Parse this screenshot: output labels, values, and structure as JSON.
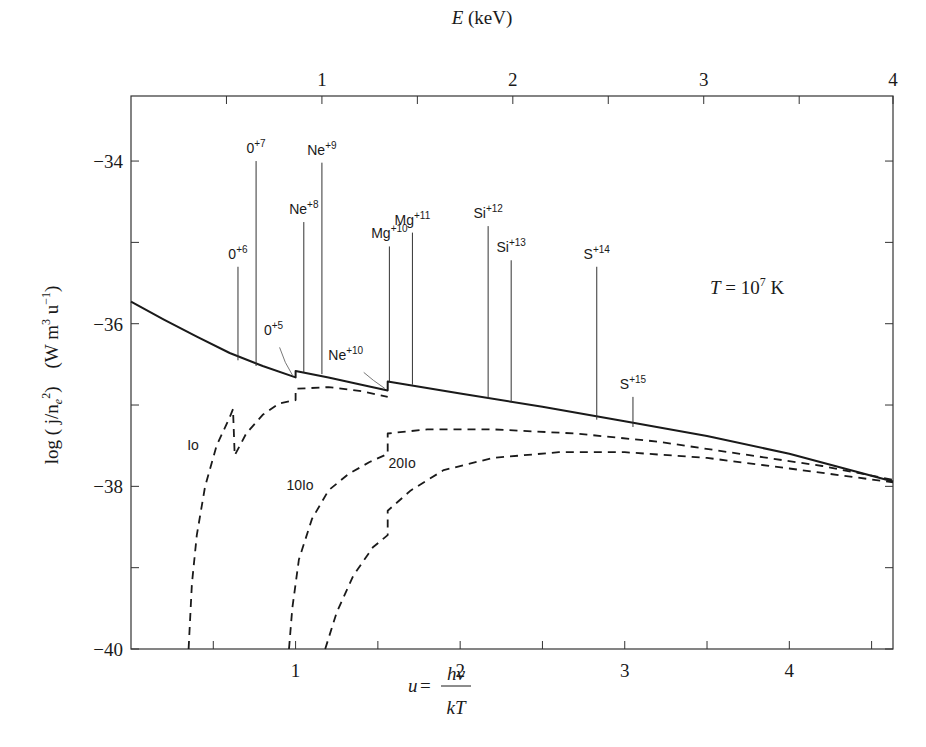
{
  "chart_data": {
    "type": "line",
    "title": "",
    "annotation": {
      "text_T": "T",
      "text_eq": " = 10",
      "text_exp": "7",
      "text_unit": " K"
    },
    "xlabel": {
      "lhs": "u",
      "eq": " = ",
      "numerator": "hν",
      "denominator": "kT"
    },
    "ylabel": {
      "main": "log ( j/n",
      "sub": "e",
      "sup": "2",
      "close": ")",
      "units": "(W m",
      "units_sup1": "3",
      "units_mid": " u",
      "units_sup2": "−1",
      "units_close": ")"
    },
    "top_xlabel": {
      "italic": "E",
      "rest": " (keV)"
    },
    "xlim": [
      0,
      4.63
    ],
    "ylim": [
      -40,
      -33.2
    ],
    "x_ticks": [
      {
        "value": 1,
        "label": "1"
      },
      {
        "value": 2,
        "label": "2"
      },
      {
        "value": 3,
        "label": "3"
      },
      {
        "value": 4,
        "label": "4"
      }
    ],
    "x_minor_ticks": [
      0.5,
      1.5,
      2.5,
      3.5,
      4.5
    ],
    "y_ticks": [
      {
        "value": -34,
        "label": "−34"
      },
      {
        "value": -36,
        "label": "−36"
      },
      {
        "value": -38,
        "label": "−38"
      },
      {
        "value": -40,
        "label": "−40"
      }
    ],
    "y_minor_ticks": [
      -35,
      -37,
      -39
    ],
    "top_ticks": [
      {
        "u": 0.58,
        "label": ""
      },
      {
        "u": 1.16,
        "label": "1"
      },
      {
        "u": 1.74,
        "label": ""
      },
      {
        "u": 2.32,
        "label": "2"
      },
      {
        "u": 2.9,
        "label": ""
      },
      {
        "u": 3.48,
        "label": "3"
      },
      {
        "u": 4.06,
        "label": ""
      },
      {
        "u": 4.63,
        "label": "4"
      }
    ],
    "series": [
      {
        "name": "total",
        "style": "solid",
        "points": [
          [
            0,
            -35.73
          ],
          [
            0.2,
            -35.95
          ],
          [
            0.4,
            -36.16
          ],
          [
            0.6,
            -36.36
          ],
          [
            0.8,
            -36.52
          ],
          [
            1.0,
            -36.66
          ],
          [
            1.0,
            -36.58
          ],
          [
            1.2,
            -36.66
          ],
          [
            1.4,
            -36.75
          ],
          [
            1.56,
            -36.82
          ],
          [
            1.56,
            -36.71
          ],
          [
            2.0,
            -36.86
          ],
          [
            2.5,
            -37.02
          ],
          [
            3.0,
            -37.2
          ],
          [
            3.5,
            -37.38
          ],
          [
            4.0,
            -37.6
          ],
          [
            4.63,
            -37.94
          ]
        ]
      },
      {
        "name": "Io",
        "label": "Io",
        "style": "dashed",
        "points": [
          [
            0.35,
            -40
          ],
          [
            0.37,
            -39.2
          ],
          [
            0.4,
            -38.6
          ],
          [
            0.45,
            -38.0
          ],
          [
            0.52,
            -37.5
          ],
          [
            0.6,
            -37.15
          ],
          [
            0.62,
            -37.05
          ],
          [
            0.63,
            -37.62
          ],
          [
            0.7,
            -37.35
          ],
          [
            0.8,
            -37.12
          ],
          [
            0.9,
            -36.98
          ],
          [
            1.0,
            -36.94
          ],
          [
            1.0,
            -36.8
          ],
          [
            1.2,
            -36.78
          ],
          [
            1.4,
            -36.83
          ],
          [
            1.56,
            -36.9
          ]
        ]
      },
      {
        "name": "10Io",
        "label": "10Io",
        "style": "dashed",
        "points": [
          [
            0.96,
            -40
          ],
          [
            0.98,
            -39.5
          ],
          [
            1.02,
            -38.9
          ],
          [
            1.1,
            -38.4
          ],
          [
            1.2,
            -38.05
          ],
          [
            1.32,
            -37.85
          ],
          [
            1.45,
            -37.7
          ],
          [
            1.56,
            -37.6
          ],
          [
            1.56,
            -37.35
          ],
          [
            1.8,
            -37.3
          ],
          [
            2.2,
            -37.3
          ],
          [
            2.7,
            -37.35
          ],
          [
            3.2,
            -37.45
          ],
          [
            3.7,
            -37.6
          ],
          [
            4.2,
            -37.75
          ],
          [
            4.63,
            -37.92
          ]
        ]
      },
      {
        "name": "20Io",
        "label": "20Io",
        "style": "dashed",
        "points": [
          [
            1.18,
            -40
          ],
          [
            1.25,
            -39.55
          ],
          [
            1.35,
            -39.1
          ],
          [
            1.47,
            -38.75
          ],
          [
            1.56,
            -38.6
          ],
          [
            1.56,
            -38.3
          ],
          [
            1.7,
            -38.05
          ],
          [
            1.9,
            -37.8
          ],
          [
            2.2,
            -37.65
          ],
          [
            2.6,
            -37.58
          ],
          [
            3.0,
            -37.58
          ],
          [
            3.5,
            -37.65
          ],
          [
            4.0,
            -37.78
          ],
          [
            4.63,
            -37.95
          ]
        ]
      }
    ],
    "lines": [
      {
        "ion": "0",
        "charge": "+6",
        "u": 0.65,
        "top": -35.3,
        "base": -36.45
      },
      {
        "ion": "0",
        "charge": "+7",
        "u": 0.76,
        "top": -34.0,
        "base": -36.52
      },
      {
        "ion": "Ne",
        "charge": "+8",
        "u": 1.05,
        "top": -34.75,
        "base": -36.6
      },
      {
        "ion": "Ne",
        "charge": "+9",
        "u": 1.16,
        "top": -34.02,
        "base": -36.62
      },
      {
        "ion": "Mg",
        "charge": "+10",
        "u": 1.57,
        "top": -35.05,
        "base": -36.71
      },
      {
        "ion": "Mg",
        "charge": "+11",
        "u": 1.71,
        "top": -34.88,
        "base": -36.75
      },
      {
        "ion": "Si",
        "charge": "+12",
        "u": 2.17,
        "top": -34.8,
        "base": -36.92
      },
      {
        "ion": "Si",
        "charge": "+13",
        "u": 2.31,
        "top": -35.22,
        "base": -36.97
      },
      {
        "ion": "S",
        "charge": "+14",
        "u": 2.83,
        "top": -35.3,
        "base": -37.18
      },
      {
        "ion": "S",
        "charge": "+15",
        "u": 3.05,
        "top": -36.9,
        "base": -37.27
      }
    ],
    "edge_labels": [
      {
        "ion": "0",
        "charge": "+5",
        "u": 1.0
      },
      {
        "ion": "Ne",
        "charge": "+10",
        "u": 1.56
      }
    ],
    "grid": false
  }
}
